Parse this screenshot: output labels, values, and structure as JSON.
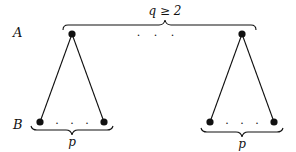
{
  "diagram": {
    "type": "bipartite-tree",
    "row_labels": {
      "top": "A",
      "bottom": "B"
    },
    "top_brace_label": "q ≥ 2",
    "bottom_brace_label": "p",
    "ellipsis": ". . .",
    "top_nodes": [
      {
        "id": "a1",
        "x": 72,
        "y": 34
      },
      {
        "id": "a2",
        "x": 242,
        "y": 34
      }
    ],
    "bottom_nodes": [
      {
        "id": "b1",
        "x": 40,
        "y": 122
      },
      {
        "id": "b2",
        "x": 104,
        "y": 122
      },
      {
        "id": "b3",
        "x": 210,
        "y": 122
      },
      {
        "id": "b4",
        "x": 274,
        "y": 122
      }
    ],
    "edges": [
      [
        "a1",
        "b1"
      ],
      [
        "a1",
        "b2"
      ],
      [
        "a2",
        "b3"
      ],
      [
        "a2",
        "b4"
      ]
    ],
    "colors": {
      "ink": "#111111",
      "background": "#ffffff"
    }
  }
}
